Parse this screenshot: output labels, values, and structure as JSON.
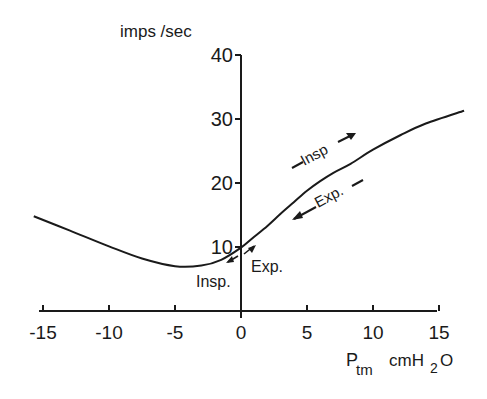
{
  "chart_data": {
    "type": "line",
    "title": "",
    "xlabel": "P_tm cmH2O",
    "xlabel_main": "P",
    "xlabel_sub": "tm",
    "xlabel_unit": "cmH",
    "xlabel_unit_sub": "2",
    "xlabel_unit_end": "O",
    "ylabel": "imps /sec",
    "xlim": [
      -15,
      15
    ],
    "ylim": [
      0,
      40
    ],
    "x_ticks": [
      -15,
      -10,
      -5,
      0,
      5,
      10,
      15
    ],
    "x_tick_labels": [
      "-15",
      "-10",
      "-5",
      "0",
      "5",
      "10",
      "15"
    ],
    "y_ticks": [
      10,
      20,
      30,
      40
    ],
    "y_tick_labels": [
      "10",
      "20",
      "30",
      "40"
    ],
    "grid": false,
    "legend": null,
    "series": [
      {
        "name": "discharge",
        "x": [
          -15.7,
          -13,
          -10,
          -7.5,
          -5,
          -3,
          -1.5,
          0,
          1,
          2,
          3,
          4,
          5,
          6,
          7,
          8.3,
          10,
          12.1,
          14,
          16.9
        ],
        "y": [
          14.8,
          12.6,
          10.1,
          8.2,
          7.0,
          7.1,
          8.0,
          9.9,
          11.6,
          13.3,
          15.2,
          17.0,
          18.8,
          20.3,
          21.6,
          23.0,
          25.2,
          27.5,
          29.3,
          31.3
        ]
      }
    ],
    "annotations": [
      {
        "text": "Insp",
        "arrow": "right",
        "near": [
          7,
          24
        ]
      },
      {
        "text": "Exp.",
        "arrow": "left",
        "near": [
          8,
          18
        ]
      },
      {
        "text": "Insp.",
        "arrow": "down-left",
        "near": [
          -1.5,
          6
        ]
      },
      {
        "text": "Exp.",
        "arrow": "up-right",
        "near": [
          1.5,
          7
        ]
      }
    ]
  },
  "labels": {
    "ylabel": "imps /sec",
    "x_main": "P",
    "x_sub": "tm",
    "x_unit": "cmH",
    "x_unit_sub": "2",
    "x_unit_end": "O",
    "ann_insp_upper": "Insp",
    "ann_exp_upper": "Exp.",
    "ann_insp_lower": "Insp.",
    "ann_exp_lower": "Exp."
  }
}
